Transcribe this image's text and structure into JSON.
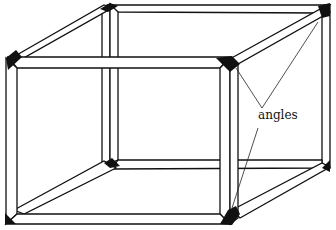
{
  "diagram": {
    "type": "wireframe-cube-illustration",
    "colors": {
      "background": "#ffffff",
      "line": "#111111",
      "joint_fill": "#111111"
    },
    "annotations": [
      {
        "text": "angles",
        "x": 258,
        "y": 109,
        "points_to": [
          "top-right-front-joint",
          "top-right-back-joint",
          "bottom-right-front-joint"
        ]
      }
    ],
    "front_frame": {
      "left": 6,
      "right": 232,
      "top": 56,
      "bottom": 224,
      "bar_width": 11
    },
    "back_frame": {
      "left": 107,
      "right": 325,
      "top": 5,
      "bottom": 162,
      "bar_width": 10
    }
  }
}
